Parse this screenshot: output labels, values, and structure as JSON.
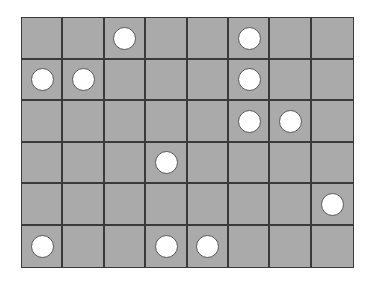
{
  "board": {
    "columns": 8,
    "rows": 6,
    "cell_color": "#aaaaaa",
    "line_color": "#3a3a3a",
    "piece_color": "#ffffff",
    "pieces": [
      {
        "row": 0,
        "col": 2
      },
      {
        "row": 0,
        "col": 5
      },
      {
        "row": 1,
        "col": 0
      },
      {
        "row": 1,
        "col": 1
      },
      {
        "row": 1,
        "col": 5
      },
      {
        "row": 2,
        "col": 5
      },
      {
        "row": 2,
        "col": 6
      },
      {
        "row": 3,
        "col": 3
      },
      {
        "row": 4,
        "col": 7
      },
      {
        "row": 5,
        "col": 0
      },
      {
        "row": 5,
        "col": 3
      },
      {
        "row": 5,
        "col": 4
      }
    ]
  }
}
